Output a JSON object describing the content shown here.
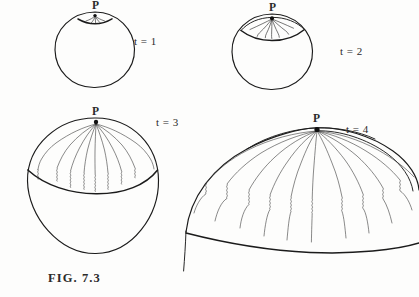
{
  "document": {
    "type": "hand-drawn scientific figure",
    "caption": "FIG. 7.3",
    "header_text_partial": "tion and radius of the universe."
  },
  "panels": [
    {
      "id": "t1",
      "time_label": "t = 1",
      "pole_label": "P",
      "shape": "circle",
      "cap_fraction": 0.06,
      "ray_count": 5,
      "description": "sphere with a very small cap of short rays at pole P"
    },
    {
      "id": "t2",
      "time_label": "t = 2",
      "pole_label": "P",
      "shape": "circle",
      "cap_fraction": 0.22,
      "ray_count": 7,
      "description": "sphere with a small lens-shaped cap of wavy rays at pole P"
    },
    {
      "id": "t3",
      "time_label": "t = 3",
      "pole_label": "P",
      "shape": "circle",
      "cap_fraction": 0.45,
      "ray_count": 9,
      "description": "sphere with a large cap of long wavy rays radiating from pole P"
    },
    {
      "id": "t4",
      "time_label": "t = 4",
      "pole_label": "P",
      "shape": "dome",
      "cap_fraction": 1.0,
      "ray_count": 11,
      "description": "large flattened dome, cap expanded to full hemisphere with long wavy rays from pole P"
    }
  ],
  "colors": {
    "ink": "#1b1b1b",
    "ray": "#2f2f2f",
    "paper": "#fdfdfc",
    "header_text": "#5d5d5d"
  }
}
